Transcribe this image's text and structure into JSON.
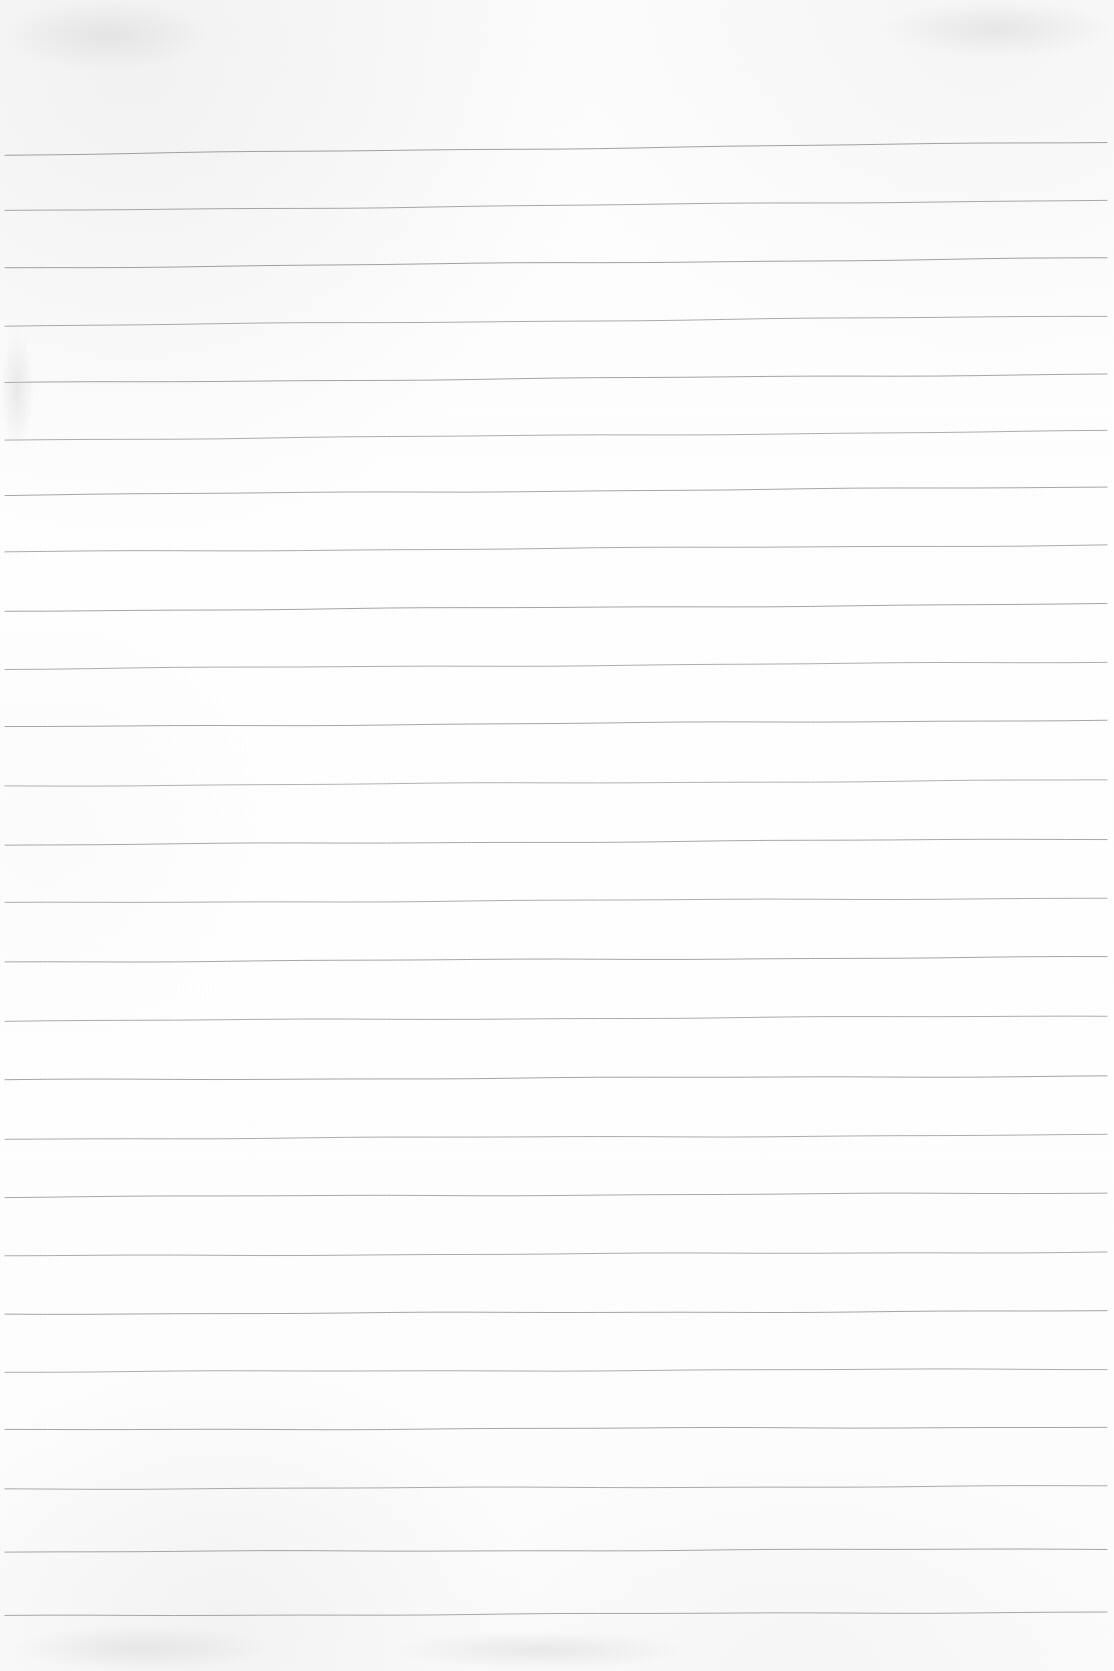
{
  "document": {
    "kind": "scanned-blank-ruled-paper",
    "title": "Blank lined notebook page (scan)",
    "page_width": 1114,
    "page_height": 1671,
    "background_color": "#fdfdfd",
    "rule_color": "#8a8a8a",
    "rule_thickness_px": 1,
    "rule_count": 26,
    "rule_spacing_px": 58,
    "left_margin_px": 5,
    "right_edge_px": 1107,
    "top_blank_margin_px": 142,
    "bottom_blank_margin_px": 56,
    "has_text_content": false,
    "has_vertical_margin_rule": false,
    "visible_text": ""
  },
  "rules": [
    {
      "index": 1,
      "y_left": 155,
      "y_right": 142,
      "opacity": 0.8
    },
    {
      "index": 2,
      "y_left": 211,
      "y_right": 200,
      "opacity": 0.74
    },
    {
      "index": 3,
      "y_left": 268,
      "y_right": 258,
      "opacity": 0.8
    },
    {
      "index": 4,
      "y_left": 326,
      "y_right": 316,
      "opacity": 0.72
    },
    {
      "index": 5,
      "y_left": 383,
      "y_right": 374,
      "opacity": 0.78
    },
    {
      "index": 6,
      "y_left": 440,
      "y_right": 431,
      "opacity": 0.7
    },
    {
      "index": 7,
      "y_left": 495,
      "y_right": 487,
      "opacity": 0.76
    },
    {
      "index": 8,
      "y_left": 552,
      "y_right": 545,
      "opacity": 0.72
    },
    {
      "index": 9,
      "y_left": 611,
      "y_right": 604,
      "opacity": 0.78
    },
    {
      "index": 10,
      "y_left": 669,
      "y_right": 662,
      "opacity": 0.7
    },
    {
      "index": 11,
      "y_left": 727,
      "y_right": 720,
      "opacity": 0.76
    },
    {
      "index": 12,
      "y_left": 786,
      "y_right": 780,
      "opacity": 0.66
    },
    {
      "index": 13,
      "y_left": 845,
      "y_right": 839,
      "opacity": 0.74
    },
    {
      "index": 14,
      "y_left": 903,
      "y_right": 898,
      "opacity": 0.7
    },
    {
      "index": 15,
      "y_left": 962,
      "y_right": 957,
      "opacity": 0.76
    },
    {
      "index": 16,
      "y_left": 1021,
      "y_right": 1016,
      "opacity": 0.72
    },
    {
      "index": 17,
      "y_left": 1080,
      "y_right": 1076,
      "opacity": 0.78
    },
    {
      "index": 18,
      "y_left": 1139,
      "y_right": 1135,
      "opacity": 0.7
    },
    {
      "index": 19,
      "y_left": 1197,
      "y_right": 1193,
      "opacity": 0.74
    },
    {
      "index": 20,
      "y_left": 1256,
      "y_right": 1252,
      "opacity": 0.72
    },
    {
      "index": 21,
      "y_left": 1314,
      "y_right": 1311,
      "opacity": 0.78
    },
    {
      "index": 22,
      "y_left": 1372,
      "y_right": 1369,
      "opacity": 0.7
    },
    {
      "index": 23,
      "y_left": 1430,
      "y_right": 1427,
      "opacity": 0.76
    },
    {
      "index": 24,
      "y_left": 1489,
      "y_right": 1486,
      "opacity": 0.72
    },
    {
      "index": 25,
      "y_left": 1552,
      "y_right": 1549,
      "opacity": 0.76
    },
    {
      "index": 26,
      "y_left": 1616,
      "y_right": 1612,
      "opacity": 0.74
    }
  ],
  "smudges": [
    {
      "name": "top-left-shadow",
      "x": 0,
      "y": 0,
      "w": 210,
      "h": 70
    },
    {
      "name": "top-right-shadow",
      "x": 880,
      "y": 0,
      "w": 234,
      "h": 58
    },
    {
      "name": "bottom-left-smudge",
      "x": 10,
      "y": 1625,
      "w": 260,
      "h": 46
    },
    {
      "name": "bottom-mid-smudge",
      "x": 390,
      "y": 1630,
      "w": 300,
      "h": 40
    },
    {
      "name": "left-edge-mark",
      "x": 0,
      "y": 330,
      "w": 34,
      "h": 120
    }
  ]
}
